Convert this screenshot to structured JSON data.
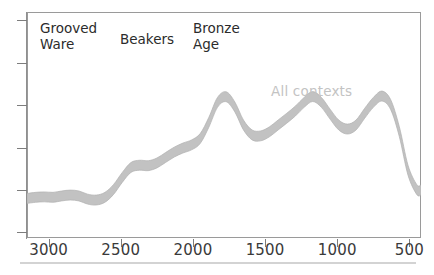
{
  "figure": {
    "title": "",
    "background": "#ffffff",
    "frame_color": "#9a9a9a",
    "band_color": "#c2c2c2",
    "band_edge_color": "#b0b0b0"
  },
  "annotations": {
    "grooved_ware": "Grooved\nWare",
    "beakers": "Beakers",
    "bronze_age": "Bronze\nAge",
    "series_label": "All contexts"
  },
  "axis": {
    "x_tick_labels": [
      "3000",
      "2500",
      "2000",
      "1500",
      "1000",
      "500"
    ],
    "x_tick_values": [
      3000,
      2500,
      2000,
      1500,
      1000,
      500
    ],
    "y_tick_count": 6,
    "y_tick_labels": [
      "",
      "",
      "",
      "",
      "",
      ""
    ]
  },
  "chart_data": {
    "type": "area",
    "title": "",
    "subtitle": "",
    "xlabel": "",
    "ylabel": "",
    "xlim": [
      3150,
      420
    ],
    "ylim": [
      0,
      1
    ],
    "x_reversed": true,
    "grid": false,
    "legend_position": "inside-upper-right",
    "legend_entries": [
      "All contexts"
    ],
    "annotations": [
      {
        "text": "Grooved Ware",
        "x": 2850,
        "y": 0.93
      },
      {
        "text": "Beakers",
        "x": 2400,
        "y": 0.88
      },
      {
        "text": "Bronze Age",
        "x": 1980,
        "y": 0.93
      },
      {
        "text": "All contexts",
        "x": 1180,
        "y": 0.63
      }
    ],
    "series": [
      {
        "name": "All contexts",
        "style": "band",
        "x": [
          3150,
          3090,
          3030,
          2970,
          2910,
          2850,
          2790,
          2730,
          2670,
          2610,
          2550,
          2490,
          2430,
          2370,
          2310,
          2250,
          2190,
          2130,
          2070,
          2010,
          1950,
          1890,
          1830,
          1770,
          1710,
          1650,
          1590,
          1530,
          1470,
          1410,
          1350,
          1290,
          1230,
          1170,
          1110,
          1050,
          990,
          930,
          870,
          810,
          750,
          690,
          630,
          570,
          510,
          450,
          420
        ],
        "y": [
          0.175,
          0.18,
          0.182,
          0.18,
          0.186,
          0.19,
          0.186,
          0.172,
          0.168,
          0.18,
          0.215,
          0.268,
          0.312,
          0.322,
          0.32,
          0.332,
          0.356,
          0.38,
          0.398,
          0.412,
          0.44,
          0.512,
          0.6,
          0.625,
          0.58,
          0.5,
          0.456,
          0.452,
          0.47,
          0.5,
          0.53,
          0.562,
          0.6,
          0.626,
          0.6,
          0.548,
          0.5,
          0.482,
          0.5,
          0.552,
          0.6,
          0.628,
          0.59,
          0.47,
          0.3,
          0.215,
          0.212
        ],
        "y_upper_offset": 0.022,
        "y_lower_offset": 0.022
      }
    ]
  }
}
